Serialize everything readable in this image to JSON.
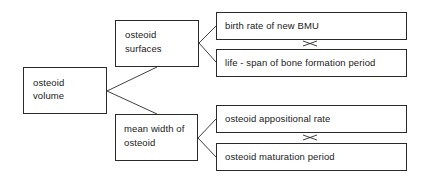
{
  "diagram": {
    "root": {
      "line1": "osteoid",
      "line2": "volume"
    },
    "branches": [
      {
        "line1": "osteoid",
        "line2": "surfaces",
        "children": [
          {
            "label": "birth rate of new BMU"
          },
          {
            "label": "life - span of bone formation period"
          }
        ],
        "relation_symbol": "×"
      },
      {
        "line1": "mean width of",
        "line2": "osteoid",
        "children": [
          {
            "label": "osteoid appositional rate"
          },
          {
            "label": "osteoid maturation period"
          }
        ],
        "relation_symbol": "×"
      }
    ]
  }
}
